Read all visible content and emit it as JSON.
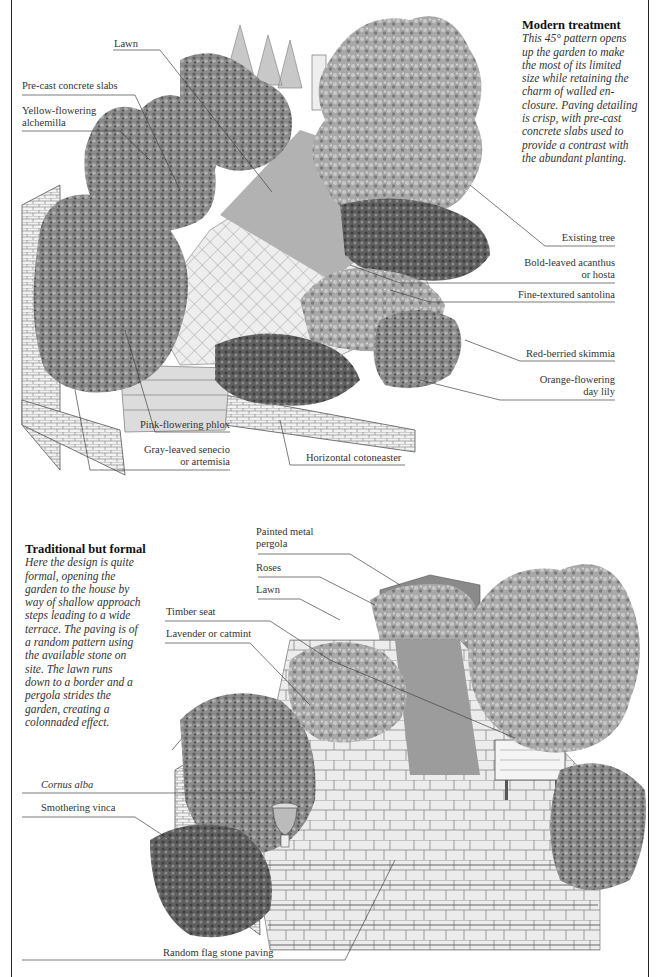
{
  "top_panel": {
    "caption": {
      "title": "Modern treatment",
      "lines": [
        "This 45° pattern opens",
        "up the garden to make",
        "the most of its limited",
        "size while retaining the",
        "charm of walled en-",
        "closure. Paving detailing",
        "is crisp, with pre-cast",
        "concrete slabs used to",
        "provide a contrast with",
        "the abundant planting."
      ]
    },
    "labels": {
      "lawn": "Lawn",
      "precast": "Pre-cast concrete slabs",
      "alchemilla_1": "Yellow-flowering",
      "alchemilla_2": "alchemilla",
      "existing_tree": "Existing tree",
      "acanthus_1": "Bold-leaved acanthus",
      "acanthus_2": "or hosta",
      "santolina": "Fine-textured santolina",
      "skimmia": "Red-berried skimmia",
      "daylily_1": "Orange-flowering",
      "daylily_2": "day lily",
      "phlox": "Pink-flowering phlox",
      "senecio_1": "Gray-leaved senecio",
      "senecio_2": "or artemisia",
      "cotoneaster": "Horizontal cotoneaster"
    }
  },
  "bottom_panel": {
    "caption": {
      "title": "Traditional but formal",
      "lines": [
        "Here the design is quite",
        "formal, opening the",
        "garden to the house by",
        "way of shallow approach",
        "steps leading to a wide",
        "terrace. The paving is of",
        "a random pattern using",
        "the available stone on",
        "site. The lawn runs",
        "down to a border and a",
        "pergola strides the",
        "garden, creating a",
        "colonnaded effect."
      ]
    },
    "labels": {
      "pergola_1": "Painted metal",
      "pergola_2": "pergola",
      "roses": "Roses",
      "lawn": "Lawn",
      "timber_seat": "Timber seat",
      "lavender": "Lavender or catmint",
      "cornus": "Cornus alba",
      "vinca": "Smothering vinca",
      "flagstone": "Random flag stone paving"
    }
  },
  "colors": {
    "ink": "#333333",
    "foliage_dark": "#6f6f6f",
    "foliage_mid": "#9a9a9a",
    "foliage_light": "#c4c4c4",
    "lawn": "#a9a9a9",
    "paving": "#e6e6e6"
  }
}
